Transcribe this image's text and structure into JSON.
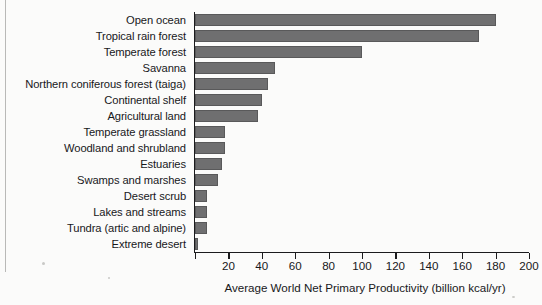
{
  "chart_data": {
    "type": "bar",
    "orientation": "horizontal",
    "title": "",
    "xlabel": "Average World Net Primary Productivity (billion kcal/yr)",
    "ylabel": "",
    "xlim": [
      0,
      200
    ],
    "xticks": [
      0,
      20,
      40,
      60,
      80,
      100,
      120,
      140,
      160,
      180,
      200
    ],
    "xtick_labels": [
      "",
      "20",
      "40",
      "60",
      "80",
      "100",
      "120",
      "140",
      "160",
      "180",
      "200"
    ],
    "grid": false,
    "legend": false,
    "bar_color": "#6f6f70",
    "bar_edge_color": "#59595a",
    "axis_color": "#1b1b1d",
    "background_color": "#fbfbfa",
    "categories": [
      "Open ocean",
      "Tropical rain forest",
      "Temperate forest",
      "Savanna",
      "Northern coniferous forest (taiga)",
      "Continental shelf",
      "Agricultural land",
      "Temperate grassland",
      "Woodland and shrubland",
      "Estuaries",
      "Swamps and marshes",
      "Desert scrub",
      "Lakes and streams",
      "Tundra (artic and alpine)",
      "Extreme desert"
    ],
    "values": [
      180,
      170,
      100,
      48,
      44,
      40,
      38,
      18,
      18,
      16,
      14,
      7,
      7,
      7,
      2
    ]
  }
}
